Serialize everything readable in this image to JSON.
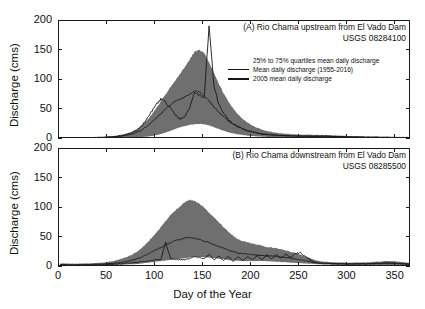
{
  "figure": {
    "background": "#ffffff",
    "axis_color": "#1a1a1a",
    "band_color": "#6f6f6f",
    "line_color": "#161616",
    "xlabel": "Day of the Year",
    "ylabel": "Discharge (cms)"
  },
  "legend": {
    "items": [
      {
        "symbol": "patch",
        "label": "25% to 75% quartiles mean daily discharge"
      },
      {
        "symbol": "line",
        "label": "Mean daily discharge (1955-2016)"
      },
      {
        "symbol": "line",
        "label": "2005 mean daily discharge"
      }
    ]
  },
  "chart_data": [
    {
      "type": "area",
      "panel": "A",
      "title_line1": "(A) Rio Chama upstream from El Vado Dam",
      "title_line2": "USGS 08284100",
      "xlabel": "",
      "ylabel": "Discharge (cms)",
      "xlim": [
        0,
        366
      ],
      "ylim": [
        0,
        200
      ],
      "xticks": [
        0,
        50,
        100,
        150,
        200,
        250,
        300,
        350
      ],
      "yticks": [
        0,
        50,
        100,
        150,
        200
      ],
      "grid": false,
      "legend_position": "upper-right-inside",
      "x": [
        1,
        6,
        11,
        16,
        21,
        26,
        31,
        36,
        41,
        46,
        51,
        56,
        61,
        66,
        71,
        76,
        81,
        86,
        91,
        96,
        101,
        106,
        111,
        116,
        121,
        126,
        131,
        136,
        141,
        146,
        151,
        156,
        161,
        166,
        171,
        176,
        181,
        186,
        191,
        196,
        201,
        206,
        211,
        216,
        221,
        226,
        231,
        236,
        241,
        246,
        251,
        256,
        261,
        266,
        271,
        276,
        281,
        286,
        291,
        296,
        301,
        306,
        311,
        316,
        321,
        326,
        331,
        336,
        341,
        346,
        351,
        356,
        361,
        366
      ],
      "series": [
        {
          "name": "25% quartile mean daily discharge",
          "values": [
            1.2,
            1.2,
            1.1,
            1.1,
            1.1,
            1.1,
            1.2,
            1.2,
            1.3,
            1.3,
            1.4,
            1.5,
            1.6,
            1.8,
            2.0,
            2.3,
            2.7,
            3.2,
            4.0,
            5.0,
            6.5,
            8.5,
            11.0,
            14.0,
            17.0,
            20.0,
            22.0,
            24.0,
            25.0,
            25.5,
            25.0,
            23.0,
            20.0,
            17.0,
            14.0,
            11.5,
            9.5,
            8.0,
            6.8,
            5.8,
            5.0,
            4.4,
            4.0,
            3.6,
            3.3,
            3.1,
            2.9,
            2.8,
            2.7,
            2.6,
            2.5,
            2.5,
            2.5,
            2.5,
            2.5,
            2.5,
            2.5,
            2.4,
            2.3,
            2.2,
            2.1,
            2.0,
            1.9,
            1.8,
            1.7,
            1.6,
            1.5,
            1.45,
            1.4,
            1.35,
            1.3,
            1.3,
            1.25,
            1.2
          ]
        },
        {
          "name": "75% quartile mean daily discharge",
          "values": [
            3.5,
            3.4,
            3.3,
            3.3,
            3.2,
            3.2,
            3.3,
            3.4,
            3.6,
            3.9,
            4.3,
            5.0,
            6.0,
            7.5,
            9.5,
            12.5,
            17.0,
            23.0,
            31.0,
            41.0,
            52.0,
            64.0,
            76.0,
            88.0,
            99.0,
            110.0,
            122.0,
            135.0,
            148.0,
            152.0,
            145.0,
            130.0,
            112.0,
            94.0,
            78.0,
            64.0,
            52.0,
            42.0,
            34.0,
            28.0,
            23.0,
            19.0,
            16.0,
            14.0,
            12.0,
            10.5,
            9.5,
            8.8,
            8.2,
            7.8,
            7.5,
            7.3,
            7.2,
            7.1,
            7.0,
            6.8,
            6.5,
            6.2,
            5.8,
            5.4,
            5.0,
            4.7,
            4.4,
            4.2,
            4.0,
            3.9,
            3.8,
            3.7,
            3.6,
            3.6,
            3.5,
            3.5,
            3.5,
            3.5
          ]
        },
        {
          "name": "Mean daily discharge (1955-2016)",
          "values": [
            2.2,
            2.2,
            2.1,
            2.1,
            2.1,
            2.1,
            2.2,
            2.3,
            2.5,
            2.7,
            3.0,
            3.5,
            4.2,
            5.2,
            6.5,
            8.5,
            11.5,
            15.5,
            21.0,
            27.5,
            35.0,
            43.0,
            51.0,
            58.0,
            64.0,
            68.0,
            71.0,
            76.0,
            82.0,
            80.0,
            73.0,
            64.0,
            55.0,
            46.0,
            38.0,
            31.0,
            25.5,
            21.0,
            17.5,
            14.5,
            12.0,
            10.2,
            8.8,
            7.8,
            7.0,
            6.4,
            5.9,
            5.6,
            5.3,
            5.1,
            5.0,
            4.9,
            4.9,
            4.8,
            4.8,
            4.7,
            4.6,
            4.4,
            4.2,
            4.0,
            3.8,
            3.6,
            3.4,
            3.2,
            3.1,
            3.0,
            2.9,
            2.8,
            2.7,
            2.6,
            2.5,
            2.4,
            2.3,
            2.3
          ]
        },
        {
          "name": "2005 mean daily discharge",
          "values": [
            2.0,
            2.0,
            1.9,
            1.9,
            2.0,
            2.0,
            2.1,
            2.2,
            2.4,
            2.6,
            3.0,
            3.6,
            4.5,
            6.0,
            8.0,
            11.0,
            15.0,
            22.0,
            34.0,
            46.0,
            58.0,
            68.0,
            62.0,
            52.0,
            41.0,
            33.0,
            39.0,
            55.0,
            78.0,
            74.0,
            70.0,
            190.0,
            92.0,
            60.0,
            44.0,
            33.0,
            26.0,
            21.0,
            17.0,
            14.0,
            12.0,
            10.0,
            8.8,
            7.8,
            7.0,
            6.5,
            6.0,
            5.6,
            5.3,
            5.0,
            4.8,
            4.7,
            4.6,
            4.5,
            4.4,
            4.3,
            4.2,
            4.0,
            3.8,
            3.6,
            3.4,
            3.2,
            3.1,
            3.0,
            2.9,
            2.8,
            2.7,
            2.6,
            2.5,
            2.4,
            2.4,
            2.3,
            2.2,
            2.2
          ]
        }
      ]
    },
    {
      "type": "area",
      "panel": "B",
      "title_line1": "(B) Rio Chama downstream from El Vado Dam",
      "title_line2": "USGS 08285500",
      "xlabel": "Day of the Year",
      "ylabel": "Discharge (cms)",
      "xlim": [
        0,
        366
      ],
      "ylim": [
        0,
        200
      ],
      "xticks": [
        0,
        50,
        100,
        150,
        200,
        250,
        300,
        350
      ],
      "yticks": [
        0,
        50,
        100,
        150,
        200
      ],
      "grid": false,
      "legend_position": "none",
      "x": [
        1,
        6,
        11,
        16,
        21,
        26,
        31,
        36,
        41,
        46,
        51,
        56,
        61,
        66,
        71,
        76,
        81,
        86,
        91,
        96,
        101,
        106,
        111,
        116,
        121,
        126,
        131,
        136,
        141,
        146,
        151,
        156,
        161,
        166,
        171,
        176,
        181,
        186,
        191,
        196,
        201,
        206,
        211,
        216,
        221,
        226,
        231,
        236,
        241,
        246,
        251,
        256,
        261,
        266,
        271,
        276,
        281,
        286,
        291,
        296,
        301,
        306,
        311,
        316,
        321,
        326,
        331,
        336,
        341,
        346,
        351,
        356,
        361,
        366
      ],
      "series": [
        {
          "name": "25% quartile mean daily discharge",
          "values": [
            2.5,
            2.5,
            2.4,
            2.4,
            2.4,
            2.5,
            2.6,
            2.7,
            2.9,
            3.0,
            3.2,
            3.4,
            3.6,
            3.9,
            4.2,
            4.6,
            5.2,
            6.0,
            7.0,
            8.0,
            9.0,
            10.0,
            11.0,
            12.0,
            13.0,
            14.0,
            15.0,
            16.0,
            17.0,
            17.0,
            16.5,
            16.0,
            15.0,
            14.0,
            13.0,
            12.0,
            11.0,
            10.5,
            10.0,
            10.0,
            10.0,
            10.0,
            10.0,
            10.0,
            9.5,
            9.0,
            8.5,
            8.0,
            7.5,
            7.0,
            6.5,
            6.0,
            5.5,
            5.0,
            4.5,
            4.2,
            4.0,
            3.8,
            3.6,
            3.5,
            3.4,
            3.3,
            3.2,
            3.1,
            3.0,
            3.0,
            2.9,
            2.9,
            2.8,
            2.8,
            2.7,
            2.7,
            2.6,
            2.6
          ]
        },
        {
          "name": "75% quartile mean daily discharge",
          "values": [
            6.0,
            6.0,
            5.8,
            5.8,
            5.8,
            6.0,
            6.2,
            6.5,
            7.0,
            7.5,
            8.5,
            10.0,
            12.0,
            14.5,
            17.5,
            21.0,
            26.0,
            32.0,
            40.0,
            49.0,
            58.0,
            68.0,
            78.0,
            88.0,
            96.0,
            102.0,
            110.0,
            114.0,
            112.0,
            108.0,
            100.0,
            92.0,
            84.0,
            76.0,
            68.0,
            60.0,
            53.0,
            47.0,
            44.0,
            42.0,
            40.0,
            38.0,
            36.0,
            34.0,
            33.0,
            32.0,
            30.0,
            28.0,
            26.0,
            24.0,
            21.0,
            18.0,
            15.0,
            12.0,
            10.0,
            9.0,
            8.5,
            8.0,
            7.8,
            7.6,
            7.5,
            7.5,
            7.6,
            7.8,
            8.0,
            8.5,
            9.0,
            9.5,
            10.0,
            10.0,
            9.5,
            8.5,
            7.5,
            7.0
          ]
        },
        {
          "name": "Mean daily discharge (1955-2016)",
          "values": [
            4.0,
            4.0,
            3.9,
            3.9,
            3.9,
            4.0,
            4.2,
            4.4,
            4.7,
            5.0,
            5.5,
            6.2,
            7.0,
            8.0,
            9.5,
            11.5,
            14.0,
            17.0,
            21.0,
            25.0,
            29.0,
            33.0,
            37.0,
            41.0,
            45.0,
            47.0,
            49.0,
            50.0,
            49.0,
            47.0,
            44.0,
            41.0,
            38.0,
            35.0,
            32.0,
            29.0,
            26.0,
            24.0,
            23.0,
            22.0,
            21.0,
            20.0,
            19.5,
            19.0,
            18.5,
            18.0,
            17.0,
            16.0,
            15.0,
            13.5,
            12.0,
            10.5,
            9.0,
            7.5,
            6.5,
            6.0,
            5.8,
            5.6,
            5.4,
            5.3,
            5.2,
            5.2,
            5.3,
            5.4,
            5.5,
            5.8,
            6.0,
            6.2,
            6.4,
            6.3,
            6.0,
            5.5,
            5.0,
            4.5
          ]
        },
        {
          "name": "2005 mean daily discharge",
          "values": [
            3.0,
            3.0,
            2.9,
            2.9,
            3.0,
            3.1,
            3.2,
            3.4,
            3.6,
            3.8,
            4.2,
            4.6,
            5.2,
            5.8,
            6.5,
            7.2,
            8.0,
            9.0,
            10.0,
            11.0,
            12.0,
            13.0,
            42.0,
            14.0,
            13.0,
            12.0,
            13.0,
            15.0,
            17.0,
            16.0,
            14.0,
            21.0,
            12.0,
            19.0,
            11.0,
            18.0,
            10.0,
            17.0,
            11.0,
            18.0,
            12.0,
            19.0,
            13.0,
            20.0,
            14.0,
            21.0,
            15.0,
            22.0,
            16.0,
            23.0,
            24.0,
            18.0,
            12.0,
            8.0,
            6.5,
            6.0,
            5.8,
            5.6,
            5.4,
            5.3,
            5.2,
            5.2,
            5.3,
            5.4,
            5.5,
            5.8,
            6.0,
            6.2,
            6.4,
            6.3,
            6.0,
            5.5,
            5.0,
            4.5
          ]
        }
      ]
    }
  ]
}
